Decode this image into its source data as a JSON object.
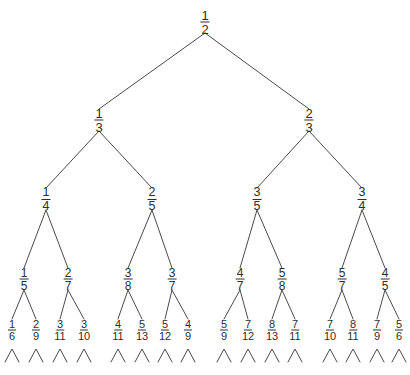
{
  "figure": {
    "name": "stern-brocot-farey-fraction-tree",
    "width": 410,
    "height": 375,
    "background_color": "#ffffff",
    "line_color": "#4a4a4a",
    "text_color": "#2e2e2e"
  },
  "chart_data": {
    "type": "diagram",
    "subtype": "binary-tree",
    "title": "",
    "xlabel": "",
    "ylabel": "",
    "levels": [
      {
        "level": 0,
        "y": 22,
        "nodes": [
          {
            "id": "n0",
            "num": "1",
            "den": "2",
            "x": 205
          }
        ]
      },
      {
        "level": 1,
        "y": 120,
        "nodes": [
          {
            "id": "n1",
            "num": "1",
            "den": "3",
            "x": 99,
            "parent": "n0"
          },
          {
            "id": "n2",
            "num": "2",
            "den": "3",
            "x": 309,
            "parent": "n0"
          }
        ]
      },
      {
        "level": 2,
        "y": 199,
        "nodes": [
          {
            "id": "n3",
            "num": "1",
            "den": "4",
            "x": 46,
            "parent": "n1"
          },
          {
            "id": "n4",
            "num": "2",
            "den": "5",
            "x": 152,
            "parent": "n1"
          },
          {
            "id": "n5",
            "num": "3",
            "den": "5",
            "x": 257,
            "parent": "n2"
          },
          {
            "id": "n6",
            "num": "3",
            "den": "4",
            "x": 362,
            "parent": "n2"
          }
        ]
      },
      {
        "level": 3,
        "y": 279,
        "nodes": [
          {
            "id": "n7",
            "num": "1",
            "den": "5",
            "x": 24,
            "parent": "n3"
          },
          {
            "id": "n8",
            "num": "2",
            "den": "7",
            "x": 68,
            "parent": "n3"
          },
          {
            "id": "n9",
            "num": "3",
            "den": "8",
            "x": 128,
            "parent": "n4"
          },
          {
            "id": "n10",
            "num": "3",
            "den": "7",
            "x": 172,
            "parent": "n4"
          },
          {
            "id": "n11",
            "num": "4",
            "den": "7",
            "x": 240,
            "parent": "n5"
          },
          {
            "id": "n12",
            "num": "5",
            "den": "8",
            "x": 282,
            "parent": "n5"
          },
          {
            "id": "n13",
            "num": "5",
            "den": "7",
            "x": 342,
            "parent": "n6"
          },
          {
            "id": "n14",
            "num": "4",
            "den": "5",
            "x": 385,
            "parent": "n6"
          }
        ]
      },
      {
        "level": 4,
        "y": 330,
        "nodes": [
          {
            "id": "n15",
            "num": "1",
            "den": "6",
            "x": 12,
            "parent": "n7"
          },
          {
            "id": "n16",
            "num": "2",
            "den": "9",
            "x": 36,
            "parent": "n7"
          },
          {
            "id": "n17",
            "num": "3",
            "den": "11",
            "x": 60,
            "parent": "n8"
          },
          {
            "id": "n18",
            "num": "3",
            "den": "10",
            "x": 84,
            "parent": "n8"
          },
          {
            "id": "n19",
            "num": "4",
            "den": "11",
            "x": 118,
            "parent": "n9"
          },
          {
            "id": "n20",
            "num": "5",
            "den": "13",
            "x": 142,
            "parent": "n9"
          },
          {
            "id": "n21",
            "num": "5",
            "den": "12",
            "x": 165,
            "parent": "n10"
          },
          {
            "id": "n22",
            "num": "4",
            "den": "9",
            "x": 188,
            "parent": "n10"
          },
          {
            "id": "n23",
            "num": "5",
            "den": "9",
            "x": 224,
            "parent": "n11"
          },
          {
            "id": "n24",
            "num": "7",
            "den": "12",
            "x": 248,
            "parent": "n11"
          },
          {
            "id": "n25",
            "num": "8",
            "den": "13",
            "x": 272,
            "parent": "n12"
          },
          {
            "id": "n26",
            "num": "7",
            "den": "11",
            "x": 295,
            "parent": "n12"
          },
          {
            "id": "n27",
            "num": "7",
            "den": "10",
            "x": 330,
            "parent": "n13"
          },
          {
            "id": "n28",
            "num": "8",
            "den": "11",
            "x": 353,
            "parent": "n13"
          },
          {
            "id": "n29",
            "num": "7",
            "den": "9",
            "x": 377,
            "parent": "n14"
          },
          {
            "id": "n30",
            "num": "5",
            "den": "6",
            "x": 399,
            "parent": "n14"
          }
        ]
      }
    ],
    "continuation_markers": {
      "symbol": "caret",
      "count": 16,
      "y_top": 349,
      "y_bottom": 362,
      "half_width": 7,
      "x_positions": [
        12,
        36,
        60,
        84,
        118,
        142,
        165,
        188,
        224,
        248,
        272,
        295,
        330,
        353,
        377,
        399
      ]
    }
  }
}
